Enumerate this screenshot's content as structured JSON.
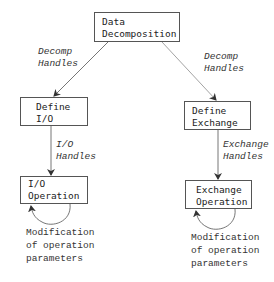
{
  "nodes": {
    "data_decomposition": {
      "lines": [
        "Data",
        "Decomposition"
      ]
    },
    "define_io": {
      "lines": [
        "Define",
        "I/O"
      ]
    },
    "define_exchange": {
      "lines": [
        "Define",
        "Exchange"
      ]
    },
    "io_operation": {
      "lines": [
        "I/O",
        "Operation"
      ]
    },
    "exchange_operation": {
      "lines": [
        "Exchange",
        "Operation"
      ]
    }
  },
  "edge_labels": {
    "decomp_left": [
      "Decomp",
      "Handles"
    ],
    "decomp_right": [
      "Decomp",
      "Handles"
    ],
    "io_handles": [
      "I/O",
      "Handles"
    ],
    "exchange_handles": [
      "Exchange",
      "Handles"
    ]
  },
  "loop_notes": {
    "left": [
      "Modification",
      "of operation",
      "parameters"
    ],
    "right": [
      "Modification",
      "of operation",
      "parameters"
    ]
  },
  "colors": {
    "line": "#555555",
    "text": "#222222"
  }
}
